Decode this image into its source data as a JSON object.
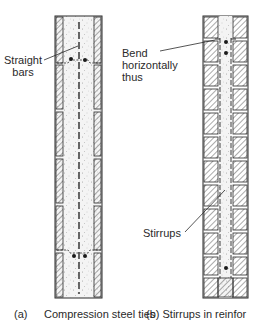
{
  "figure_a": {
    "label_straight_bars_line1": "Straight",
    "label_straight_bars_line2": "bars",
    "caption_tag": "(a)",
    "caption_text": "Compression steel ties"
  },
  "figure_b": {
    "label_bend_line1": "Bend",
    "label_bend_line2": "horizontally",
    "label_bend_line3": "thus",
    "label_stirrups": "Stirrups",
    "caption_text": "(b)  Stirrups in reinfor"
  },
  "colors": {
    "line": "#2a2a2a",
    "concrete_fill": "#f2f2f2",
    "hatch": "#4a4a4a",
    "background": "#ffffff"
  }
}
